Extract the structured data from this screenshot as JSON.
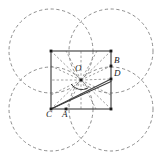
{
  "figure": {
    "kind": "geometric-construction",
    "background_color": "#ffffff",
    "solid_stroke_color": "#3f3f3f",
    "dashed_stroke_color": "#777777",
    "point_color": "#1a1a1a",
    "label_color": "#1a1a1a"
  },
  "square": {
    "name": "outer-square",
    "left": 51,
    "top": 51,
    "right": 111,
    "bottom": 109,
    "side": 60,
    "stroke_width": 1.2
  },
  "circles": [
    {
      "id": "circle-top-left",
      "cx": 51,
      "cy": 51,
      "r": 42
    },
    {
      "id": "circle-top-right",
      "cx": 111,
      "cy": 51,
      "r": 42
    },
    {
      "id": "circle-bottom-left",
      "cx": 51,
      "cy": 109,
      "r": 42
    },
    {
      "id": "circle-bottom-right",
      "cx": 111,
      "cy": 109,
      "r": 42
    }
  ],
  "points": [
    {
      "id": "point-O",
      "label": "O",
      "x": 81,
      "y": 80,
      "label_x": 75,
      "label_y": 66,
      "marked": true
    },
    {
      "id": "point-A",
      "label": "A",
      "x": 66,
      "y": 109,
      "label_x": 63,
      "label_y": 111,
      "marked": true
    },
    {
      "id": "point-B",
      "label": "B",
      "x": 111,
      "y": 66,
      "label_x": 114,
      "label_y": 58,
      "marked": true
    },
    {
      "id": "point-C",
      "label": "C",
      "x": 51,
      "y": 109,
      "label_x": 46,
      "label_y": 111,
      "marked": true
    },
    {
      "id": "point-D",
      "label": "D",
      "x": 111,
      "y": 79,
      "label_x": 114,
      "label_y": 71,
      "marked": true
    }
  ],
  "corner_markers": [
    {
      "id": "corner-top-left",
      "x": 51,
      "y": 51
    },
    {
      "id": "corner-top-right",
      "x": 111,
      "y": 51
    },
    {
      "id": "corner-bottom-right",
      "x": 111,
      "y": 109
    }
  ],
  "solid_segments": [
    {
      "id": "segment-C-to-D",
      "x1": 51,
      "y1": 109,
      "x2": 111,
      "y2": 79
    },
    {
      "id": "segment-C-to-D-lower",
      "x1": 51,
      "y1": 109,
      "x2": 111,
      "y2": 81
    }
  ],
  "rays_from_O": [
    {
      "id": "ray-O-1",
      "x2": 51,
      "y2": 51
    },
    {
      "id": "ray-O-2",
      "x2": 66,
      "y2": 51
    },
    {
      "id": "ray-O-3",
      "x2": 81,
      "y2": 51
    },
    {
      "id": "ray-O-4",
      "x2": 97,
      "y2": 51
    },
    {
      "id": "ray-O-5",
      "x2": 111,
      "y2": 51
    },
    {
      "id": "ray-O-6",
      "x2": 111,
      "y2": 66
    },
    {
      "id": "ray-O-7",
      "x2": 111,
      "y2": 79
    },
    {
      "id": "ray-O-8",
      "x2": 111,
      "y2": 95
    },
    {
      "id": "ray-O-9",
      "x2": 111,
      "y2": 109
    },
    {
      "id": "ray-O-10",
      "x2": 96,
      "y2": 109
    },
    {
      "id": "ray-O-11",
      "x2": 81,
      "y2": 109
    },
    {
      "id": "ray-O-12",
      "x2": 66,
      "y2": 109
    },
    {
      "id": "ray-O-13",
      "x2": 51,
      "y2": 109
    },
    {
      "id": "ray-O-14",
      "x2": 51,
      "y2": 95
    },
    {
      "id": "ray-O-15",
      "x2": 51,
      "y2": 80
    },
    {
      "id": "ray-O-16",
      "x2": 51,
      "y2": 66
    }
  ],
  "angle_arc": {
    "id": "angle-arc-at-O",
    "path": "M 71 84 A 13 13 0 0 0 88 88",
    "stroke_width": 1.0
  },
  "labels": {
    "O": "O",
    "A": "A",
    "B": "B",
    "C": "C",
    "D": "D"
  }
}
